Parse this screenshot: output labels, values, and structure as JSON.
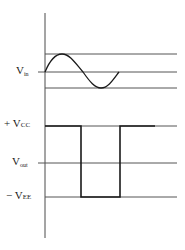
{
  "diagram": {
    "type": "comparator-waveforms",
    "input": {
      "label_main": "V",
      "label_sub": "in",
      "waveform": "sine",
      "levels": {
        "upper": "+peak",
        "center": "0",
        "lower": "-peak"
      }
    },
    "output": {
      "label_main": "V",
      "label_sub": "out",
      "waveform": "square",
      "positive_rail": {
        "prefix": "+ ",
        "main": "V",
        "sub": "CC"
      },
      "negative_rail": {
        "prefix": "− ",
        "main": "V",
        "sub": "EE"
      }
    },
    "colors": {
      "line": "#4a4a4a",
      "wave": "#1a1a1a",
      "background": "#ffffff"
    }
  }
}
